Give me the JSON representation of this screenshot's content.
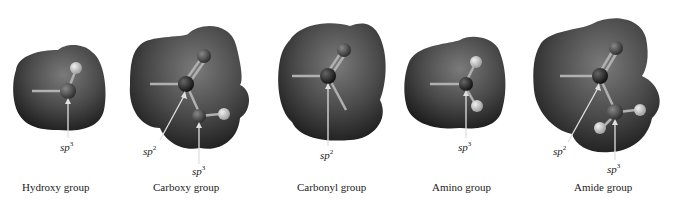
{
  "figure": {
    "panels": [
      {
        "caption": "Hydroxy group",
        "labels": [
          {
            "base": "sp",
            "exp": "3"
          }
        ]
      },
      {
        "caption": "Carboxy group",
        "labels": [
          {
            "base": "sp",
            "exp": "2"
          },
          {
            "base": "sp",
            "exp": "3"
          }
        ]
      },
      {
        "caption": "Carbonyl group",
        "labels": [
          {
            "base": "sp",
            "exp": "2"
          }
        ]
      },
      {
        "caption": "Amino group",
        "labels": [
          {
            "base": "sp",
            "exp": "3"
          }
        ]
      },
      {
        "caption": "Amide group",
        "labels": [
          {
            "base": "sp",
            "exp": "2"
          },
          {
            "base": "sp",
            "exp": "3"
          }
        ]
      }
    ],
    "colors": {
      "surface_dark": "#1c1c1c",
      "surface_mid": "#4a4a4a",
      "surface_light": "#7a7a7a",
      "atom_dark": "#141414",
      "atom_mid": "#3e3e3e",
      "atom_hydrogen": "#c8c8c8",
      "bond": "#b0b0b0",
      "arrow": "#e0e0e0"
    }
  }
}
